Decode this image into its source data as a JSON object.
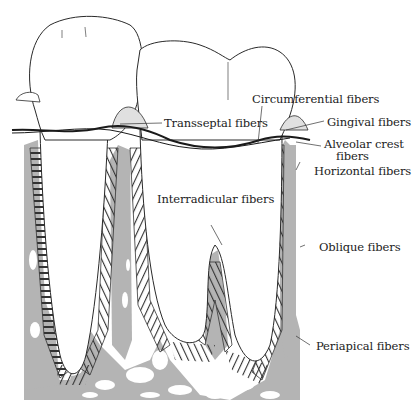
{
  "colors": {
    "bone": "#b4b4b4",
    "outline": "#2a2a2a",
    "fiber": "#333333",
    "background": "#ffffff",
    "text": "#222222"
  },
  "labels": {
    "circumferential": "Circumferential fibers",
    "transseptal": "Transseptal fibers",
    "gingival": "Gingival fibers",
    "alveolar_crest_line1": "Alveolar crest",
    "alveolar_crest_line2": "fibers",
    "horizontal": "Horizontal fibers",
    "interradicular": "Interradicular fibers",
    "oblique": "Oblique fibers",
    "periapical": "Periapical fibers"
  }
}
